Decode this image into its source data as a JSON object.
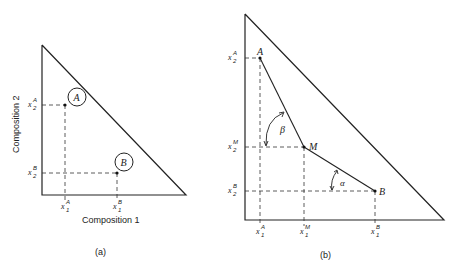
{
  "panel_a": {
    "caption": "(a)",
    "x_axis_label": "Composition 1",
    "y_axis_label": "Composition 2",
    "points": [
      {
        "name": "A",
        "x_tick": {
          "base": "x",
          "sub": "1",
          "sup": "A"
        },
        "y_tick": {
          "base": "x",
          "sub": "2",
          "sup": "A"
        }
      },
      {
        "name": "B",
        "x_tick": {
          "base": "x",
          "sub": "1",
          "sup": "B"
        },
        "y_tick": {
          "base": "x",
          "sub": "2",
          "sup": "B"
        }
      }
    ]
  },
  "panel_b": {
    "caption": "(b)",
    "points": [
      {
        "name": "A",
        "x_tick": {
          "base": "x",
          "sub": "1",
          "sup": "A"
        },
        "y_tick": {
          "base": "x",
          "sub": "2",
          "sup": "A"
        }
      },
      {
        "name": "M",
        "x_tick": {
          "base": "x",
          "sub": "1",
          "sup": "M"
        },
        "y_tick": {
          "base": "x",
          "sub": "2",
          "sup": "M"
        }
      },
      {
        "name": "B",
        "x_tick": {
          "base": "x",
          "sub": "1",
          "sup": "B"
        },
        "y_tick": {
          "base": "x",
          "sub": "2",
          "sup": "B"
        }
      }
    ],
    "angles": [
      {
        "name": "beta",
        "symbol": "β"
      },
      {
        "name": "alpha",
        "symbol": "α"
      }
    ]
  }
}
